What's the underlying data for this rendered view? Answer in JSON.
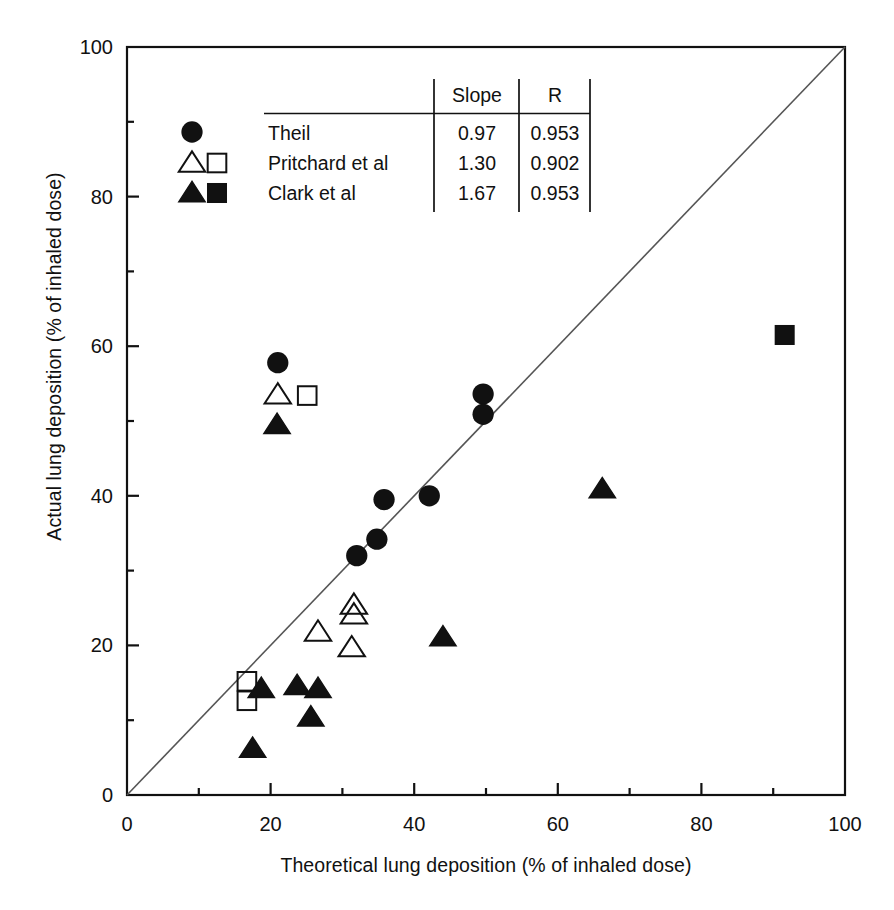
{
  "chart_data": {
    "type": "scatter",
    "title": "",
    "xlabel": "Theoretical lung deposition  (% of inhaled dose)",
    "ylabel": "Actual lung deposition  (% of inhaled dose)",
    "xlim": [
      0,
      100
    ],
    "ylim": [
      0,
      100
    ],
    "xticks": [
      0,
      20,
      40,
      60,
      80,
      100
    ],
    "yticks": [
      0,
      20,
      40,
      60,
      80,
      100
    ],
    "minor_tick_step": 10,
    "grid": false,
    "identity_line": {
      "from": [
        0,
        0
      ],
      "to": [
        100,
        100
      ],
      "label": "line of identity"
    },
    "marker_color": "#111111",
    "series": [
      {
        "name": "Theil",
        "marker": "filled-circle",
        "points": [
          [
            21.0,
            57.8
          ],
          [
            35.8,
            39.5
          ],
          [
            42.1,
            40.0
          ],
          [
            32.0,
            32.0
          ],
          [
            34.8,
            34.2
          ],
          [
            49.6,
            53.6
          ],
          [
            49.6,
            50.9
          ]
        ]
      },
      {
        "name": "Pritchard et al (triangle)",
        "marker": "open-triangle",
        "points": [
          [
            21.0,
            53.5
          ],
          [
            31.6,
            25.4
          ],
          [
            31.6,
            24.1
          ],
          [
            26.6,
            21.8
          ],
          [
            31.3,
            19.7
          ]
        ]
      },
      {
        "name": "Pritchard et al (square)",
        "marker": "open-square",
        "points": [
          [
            25.1,
            53.4
          ],
          [
            16.7,
            15.2
          ],
          [
            16.7,
            12.6
          ]
        ]
      },
      {
        "name": "Clark et al (triangle)",
        "marker": "filled-triangle",
        "points": [
          [
            20.9,
            49.5
          ],
          [
            18.7,
            14.2
          ],
          [
            23.7,
            14.6
          ],
          [
            26.6,
            14.2
          ],
          [
            25.6,
            10.4
          ],
          [
            17.5,
            6.2
          ],
          [
            44.0,
            21.1
          ],
          [
            66.2,
            40.9
          ]
        ]
      },
      {
        "name": "Clark et al (square)",
        "marker": "filled-square",
        "points": [
          [
            91.6,
            61.5
          ]
        ]
      }
    ],
    "legend": {
      "position": "top-left-inside",
      "columns": [
        "",
        "Slope",
        "R"
      ],
      "rows": [
        {
          "symbols": [
            "filled-circle"
          ],
          "label": "Theil",
          "slope": "0.97",
          "r": "0.953"
        },
        {
          "symbols": [
            "open-triangle",
            "open-square"
          ],
          "label": "Pritchard et al",
          "slope": "1.30",
          "r": "0.902"
        },
        {
          "symbols": [
            "filled-triangle",
            "filled-square"
          ],
          "label": "Clark et al",
          "slope": "1.67",
          "r": "0.953"
        }
      ]
    }
  },
  "axes": {
    "x_tick_labels": [
      "0",
      "20",
      "40",
      "60",
      "80",
      "100"
    ],
    "y_tick_labels": [
      "0",
      "20",
      "40",
      "60",
      "80",
      "100"
    ],
    "x_title": "Theoretical lung deposition  (% of inhaled dose)",
    "y_title": "Actual lung deposition  (% of inhaled dose)"
  },
  "legend_table": {
    "col_slope": "Slope",
    "col_r": "R",
    "row1_label": "Theil",
    "row1_slope": "0.97",
    "row1_r": "0.953",
    "row2_label": "Pritchard et al",
    "row2_slope": "1.30",
    "row2_r": "0.902",
    "row3_label": "Clark et al",
    "row3_slope": "1.67",
    "row3_r": "0.953"
  }
}
